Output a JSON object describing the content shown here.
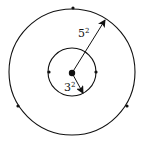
{
  "diagram": {
    "outer_label": {
      "base": "5",
      "exp": "2"
    },
    "inner_label": {
      "base": "3",
      "exp": "2"
    },
    "stroke_color": "#111111",
    "background": "#ffffff"
  }
}
